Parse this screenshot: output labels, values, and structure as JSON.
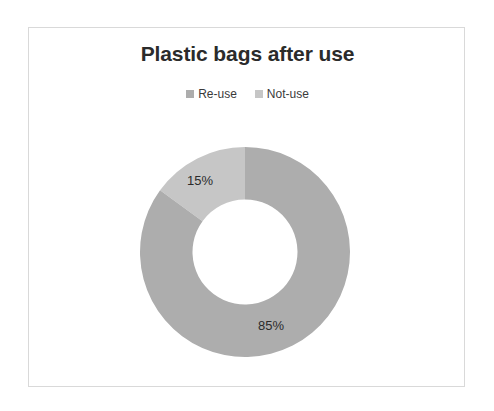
{
  "chart_data": {
    "type": "pie",
    "variant": "donut",
    "title": "Plastic bags after use",
    "subtitle": "",
    "xlabel": "",
    "ylabel": "",
    "categories": [
      "Re-use",
      "Not-use"
    ],
    "values": [
      15,
      85
    ],
    "value_unit": "%",
    "data_labels": [
      "15%",
      "85%"
    ],
    "colors": [
      "#c6c6c6",
      "#adadad"
    ],
    "legend": {
      "position": "top",
      "entries": [
        {
          "label": "Re-use",
          "color": "#adadad"
        },
        {
          "label": "Not-use",
          "color": "#c6c6c6"
        }
      ]
    },
    "grid": false,
    "start_angle_deg": 0,
    "direction": "counterclockwise",
    "inner_radius_ratio": 0.5,
    "total": 100
  },
  "frame": {
    "border_color": "#d9d9d9",
    "background": "#ffffff"
  }
}
